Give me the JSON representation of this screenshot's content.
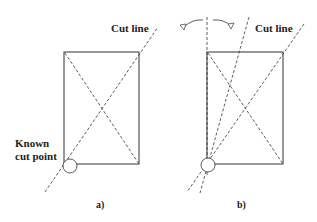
{
  "panels": [
    {
      "id": "a",
      "caption": "a)",
      "cut_line_label": "Cut line",
      "known_point_label_line1": "Known",
      "known_point_label_line2": "cut point"
    },
    {
      "id": "b",
      "caption": "b)",
      "cut_line_label": "Cut line"
    }
  ],
  "colors": {
    "stroke": "#333333",
    "background": "#ffffff"
  }
}
